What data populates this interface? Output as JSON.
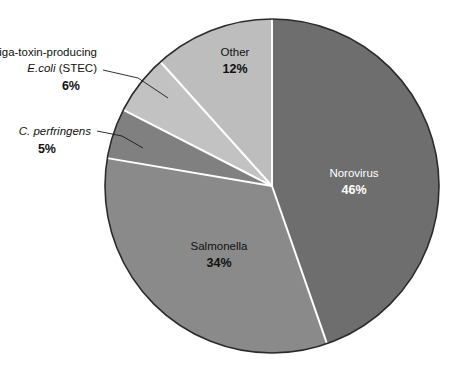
{
  "chart_data": {
    "type": "pie",
    "title": "",
    "subtitle": "",
    "xlabel": "",
    "ylabel": "",
    "legend_position": "none",
    "grid": false,
    "units": "percent",
    "total": 103,
    "start_angle_deg": 90,
    "direction": "counterclockwise",
    "categories": [
      "Other",
      "Shiga-toxin-producing E.coli (STEC)",
      "C. perfringens",
      "Salmonella",
      "Norovirus"
    ],
    "values": [
      12,
      6,
      5,
      34,
      46
    ],
    "labels": [
      "12%",
      "6%",
      "5%",
      "34%",
      "46%"
    ],
    "colors": [
      "#bdbdbd",
      "#c2c2c2",
      "#808080",
      "#8a8a8a",
      "#6e6e6e"
    ],
    "slices": [
      {
        "id": "other",
        "name": "Other",
        "value": 12,
        "label": "12%",
        "color": "#bdbdbd",
        "label_placement": "inside",
        "text_color": "#111111"
      },
      {
        "id": "stec",
        "name_line1": "Shiga-toxin-producing",
        "name_line2_italic": "E.coli",
        "name_line2_rest": " (STEC)",
        "value": 6,
        "label": "6%",
        "color": "#c2c2c2",
        "label_placement": "callout",
        "text_color": "#111111"
      },
      {
        "id": "cperfringens",
        "name_italic": "C. perfringens",
        "value": 5,
        "label": "5%",
        "color": "#808080",
        "label_placement": "callout",
        "text_color": "#111111"
      },
      {
        "id": "salmonella",
        "name": "Salmonella",
        "value": 34,
        "label": "34%",
        "color": "#8a8a8a",
        "label_placement": "inside",
        "text_color": "#111111"
      },
      {
        "id": "norovirus",
        "name": "Norovirus",
        "value": 46,
        "label": "46%",
        "color": "#6e6e6e",
        "label_placement": "inside",
        "text_color": "#ffffff"
      }
    ]
  },
  "figure": {
    "background": "#ffffff",
    "outline_color": "#2b2b2b",
    "separator_color": "#ffffff",
    "leader_color": "#1a1a1a"
  }
}
